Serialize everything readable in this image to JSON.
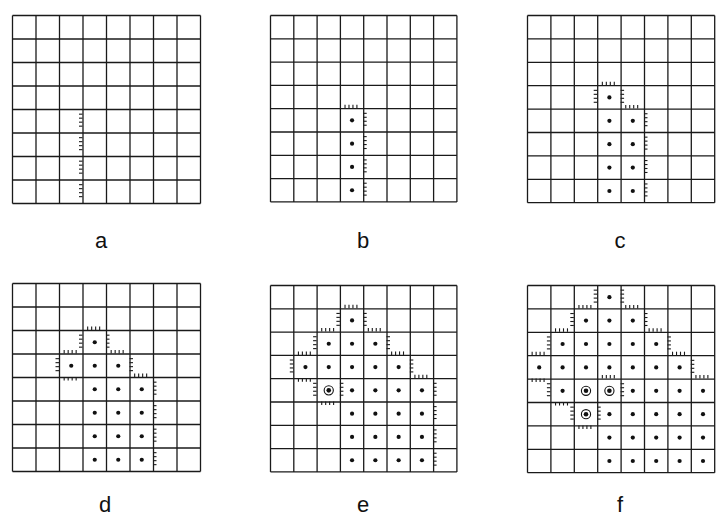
{
  "figure": {
    "grid_size": 8,
    "line_color": "#1a1a1a",
    "dot_color": "#111111",
    "panels": [
      {
        "label": "a",
        "origin": [
          12,
          15
        ],
        "cell": 23.5,
        "dots": [],
        "seeds": [],
        "ticks": [
          {
            "col": 3,
            "row": 4,
            "side": "left"
          },
          {
            "col": 3,
            "row": 5,
            "side": "left"
          },
          {
            "col": 3,
            "row": 6,
            "side": "left"
          },
          {
            "col": 3,
            "row": 7,
            "side": "left"
          }
        ]
      },
      {
        "label": "b",
        "origin": [
          270,
          15
        ],
        "cell": 23.3,
        "dots": [
          [
            3,
            4
          ],
          [
            3,
            5
          ],
          [
            3,
            6
          ],
          [
            3,
            7
          ]
        ],
        "seeds": [],
        "ticks": [
          {
            "col": 3,
            "row": 4,
            "side": "top"
          },
          {
            "col": 3,
            "row": 4,
            "side": "right"
          },
          {
            "col": 3,
            "row": 5,
            "side": "right"
          },
          {
            "col": 3,
            "row": 6,
            "side": "right"
          },
          {
            "col": 3,
            "row": 7,
            "side": "right"
          }
        ]
      },
      {
        "label": "c",
        "origin": [
          527,
          15
        ],
        "cell": 23.4,
        "dots": [
          [
            3,
            3
          ],
          [
            3,
            4
          ],
          [
            3,
            5
          ],
          [
            3,
            6
          ],
          [
            3,
            7
          ],
          [
            4,
            4
          ],
          [
            4,
            5
          ],
          [
            4,
            6
          ],
          [
            4,
            7
          ]
        ],
        "seeds": [],
        "ticks": [
          {
            "col": 3,
            "row": 3,
            "side": "top"
          },
          {
            "col": 3,
            "row": 3,
            "side": "left"
          },
          {
            "col": 3,
            "row": 3,
            "side": "right"
          },
          {
            "col": 4,
            "row": 4,
            "side": "top"
          },
          {
            "col": 4,
            "row": 4,
            "side": "right"
          },
          {
            "col": 4,
            "row": 5,
            "side": "right"
          },
          {
            "col": 4,
            "row": 6,
            "side": "right"
          },
          {
            "col": 4,
            "row": 7,
            "side": "right"
          }
        ]
      },
      {
        "label": "d",
        "origin": [
          12,
          283
        ],
        "cell": 23.5,
        "dots": [
          [
            3,
            2
          ],
          [
            2,
            3
          ],
          [
            3,
            3
          ],
          [
            4,
            3
          ],
          [
            3,
            4
          ],
          [
            4,
            4
          ],
          [
            5,
            4
          ],
          [
            3,
            5
          ],
          [
            4,
            5
          ],
          [
            5,
            5
          ],
          [
            3,
            6
          ],
          [
            4,
            6
          ],
          [
            5,
            6
          ],
          [
            3,
            7
          ],
          [
            4,
            7
          ],
          [
            5,
            7
          ]
        ],
        "seeds": [],
        "ticks": [
          {
            "col": 3,
            "row": 2,
            "side": "top"
          },
          {
            "col": 3,
            "row": 2,
            "side": "left"
          },
          {
            "col": 3,
            "row": 2,
            "side": "right"
          },
          {
            "col": 2,
            "row": 3,
            "side": "top"
          },
          {
            "col": 2,
            "row": 3,
            "side": "left"
          },
          {
            "col": 2,
            "row": 3,
            "side": "bottom"
          },
          {
            "col": 4,
            "row": 3,
            "side": "top"
          },
          {
            "col": 4,
            "row": 3,
            "side": "right"
          },
          {
            "col": 5,
            "row": 4,
            "side": "top"
          },
          {
            "col": 5,
            "row": 4,
            "side": "right"
          },
          {
            "col": 5,
            "row": 5,
            "side": "right"
          },
          {
            "col": 5,
            "row": 6,
            "side": "right"
          },
          {
            "col": 5,
            "row": 7,
            "side": "right"
          }
        ]
      },
      {
        "label": "e",
        "origin": [
          270,
          285
        ],
        "cell": 23.3,
        "dots": [
          [
            3,
            1
          ],
          [
            2,
            2
          ],
          [
            3,
            2
          ],
          [
            4,
            2
          ],
          [
            1,
            3
          ],
          [
            2,
            3
          ],
          [
            3,
            3
          ],
          [
            4,
            3
          ],
          [
            5,
            3
          ],
          [
            3,
            4
          ],
          [
            4,
            4
          ],
          [
            5,
            4
          ],
          [
            6,
            4
          ],
          [
            3,
            5
          ],
          [
            4,
            5
          ],
          [
            5,
            5
          ],
          [
            6,
            5
          ],
          [
            3,
            6
          ],
          [
            4,
            6
          ],
          [
            5,
            6
          ],
          [
            6,
            6
          ],
          [
            3,
            7
          ],
          [
            4,
            7
          ],
          [
            5,
            7
          ],
          [
            6,
            7
          ]
        ],
        "seeds": [
          [
            2,
            4
          ]
        ],
        "ticks": [
          {
            "col": 3,
            "row": 1,
            "side": "top"
          },
          {
            "col": 3,
            "row": 1,
            "side": "left"
          },
          {
            "col": 3,
            "row": 1,
            "side": "right"
          },
          {
            "col": 2,
            "row": 2,
            "side": "top"
          },
          {
            "col": 2,
            "row": 2,
            "side": "left"
          },
          {
            "col": 4,
            "row": 2,
            "side": "top"
          },
          {
            "col": 4,
            "row": 2,
            "side": "right"
          },
          {
            "col": 1,
            "row": 3,
            "side": "top"
          },
          {
            "col": 1,
            "row": 3,
            "side": "left"
          },
          {
            "col": 1,
            "row": 3,
            "side": "bottom"
          },
          {
            "col": 5,
            "row": 3,
            "side": "top"
          },
          {
            "col": 5,
            "row": 3,
            "side": "right"
          },
          {
            "col": 2,
            "row": 4,
            "side": "left"
          },
          {
            "col": 2,
            "row": 4,
            "side": "right"
          },
          {
            "col": 2,
            "row": 4,
            "side": "bottom"
          },
          {
            "col": 6,
            "row": 4,
            "side": "top"
          },
          {
            "col": 6,
            "row": 4,
            "side": "right"
          },
          {
            "col": 6,
            "row": 5,
            "side": "right"
          },
          {
            "col": 6,
            "row": 6,
            "side": "right"
          },
          {
            "col": 6,
            "row": 7,
            "side": "right"
          }
        ]
      },
      {
        "label": "f",
        "origin": [
          527,
          285
        ],
        "cell": 23.4,
        "dots": [
          [
            3,
            0
          ],
          [
            2,
            1
          ],
          [
            3,
            1
          ],
          [
            4,
            1
          ],
          [
            1,
            2
          ],
          [
            2,
            2
          ],
          [
            3,
            2
          ],
          [
            4,
            2
          ],
          [
            5,
            2
          ],
          [
            0,
            3
          ],
          [
            1,
            3
          ],
          [
            2,
            3
          ],
          [
            3,
            3
          ],
          [
            4,
            3
          ],
          [
            5,
            3
          ],
          [
            6,
            3
          ],
          [
            1,
            4
          ],
          [
            4,
            4
          ],
          [
            5,
            4
          ],
          [
            6,
            4
          ],
          [
            7,
            4
          ],
          [
            3,
            5
          ],
          [
            4,
            5
          ],
          [
            5,
            5
          ],
          [
            6,
            5
          ],
          [
            7,
            5
          ],
          [
            3,
            6
          ],
          [
            4,
            6
          ],
          [
            5,
            6
          ],
          [
            6,
            6
          ],
          [
            7,
            6
          ],
          [
            3,
            7
          ],
          [
            4,
            7
          ],
          [
            5,
            7
          ],
          [
            6,
            7
          ],
          [
            7,
            7
          ]
        ],
        "seeds": [
          [
            2,
            4
          ],
          [
            3,
            4
          ],
          [
            2,
            5
          ]
        ],
        "ticks": [
          {
            "col": 3,
            "row": 0,
            "side": "left"
          },
          {
            "col": 3,
            "row": 0,
            "side": "right"
          },
          {
            "col": 2,
            "row": 1,
            "side": "top"
          },
          {
            "col": 2,
            "row": 1,
            "side": "left"
          },
          {
            "col": 4,
            "row": 1,
            "side": "top"
          },
          {
            "col": 4,
            "row": 1,
            "side": "right"
          },
          {
            "col": 1,
            "row": 2,
            "side": "top"
          },
          {
            "col": 1,
            "row": 2,
            "side": "left"
          },
          {
            "col": 5,
            "row": 2,
            "side": "top"
          },
          {
            "col": 5,
            "row": 2,
            "side": "right"
          },
          {
            "col": 0,
            "row": 3,
            "side": "top"
          },
          {
            "col": 0,
            "row": 3,
            "side": "bottom"
          },
          {
            "col": 6,
            "row": 3,
            "side": "top"
          },
          {
            "col": 6,
            "row": 3,
            "side": "right"
          },
          {
            "col": 1,
            "row": 4,
            "side": "left"
          },
          {
            "col": 1,
            "row": 4,
            "side": "bottom"
          },
          {
            "col": 3,
            "row": 4,
            "side": "top"
          },
          {
            "col": 3,
            "row": 4,
            "side": "right"
          },
          {
            "col": 7,
            "row": 4,
            "side": "top"
          },
          {
            "col": 2,
            "row": 5,
            "side": "left"
          },
          {
            "col": 2,
            "row": 5,
            "side": "right"
          },
          {
            "col": 2,
            "row": 5,
            "side": "bottom"
          }
        ]
      }
    ],
    "labels": [
      {
        "text": "a",
        "x": 101,
        "y": 228
      },
      {
        "text": "b",
        "x": 363,
        "y": 228
      },
      {
        "text": "c",
        "x": 620,
        "y": 228
      },
      {
        "text": "d",
        "x": 105,
        "y": 492
      },
      {
        "text": "e",
        "x": 363,
        "y": 492
      },
      {
        "text": "f",
        "x": 620,
        "y": 492
      }
    ]
  }
}
